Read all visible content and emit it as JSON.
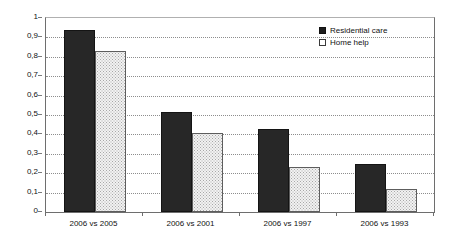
{
  "chart_data": {
    "type": "bar",
    "title": "",
    "subtitle": "",
    "xlabel": "",
    "ylabel": "Correlation coefficient",
    "categories": [
      "2006 vs 2005",
      "2006 vs 2001",
      "2006 vs 1997",
      "2006 vs 1993"
    ],
    "series": [
      {
        "name": "Residential care",
        "values": [
          0.94,
          0.515,
          0.43,
          0.25
        ],
        "color": "#272727",
        "swatch": "filled-square"
      },
      {
        "name": "Home help",
        "values": [
          0.83,
          0.405,
          0.23,
          0.117
        ],
        "color": "#f2f2f2",
        "swatch": "open-square"
      }
    ],
    "ylim": [
      0,
      1
    ],
    "ytick_step": 0.1,
    "ytick_labels": [
      "1",
      "0,9",
      "0,8",
      "0,7",
      "0,6",
      "0,5",
      "0,4",
      "0,3",
      "0,2",
      "0,1",
      "0"
    ],
    "ytick_values": [
      1,
      0.9,
      0.8,
      0.7,
      0.6,
      0.5,
      0.4,
      0.3,
      0.2,
      0.1,
      0
    ],
    "grid": "horizontal-dotted",
    "legend_position": "top-right-inside",
    "decimal_separator": ",",
    "plot_border": true,
    "annotations": []
  }
}
